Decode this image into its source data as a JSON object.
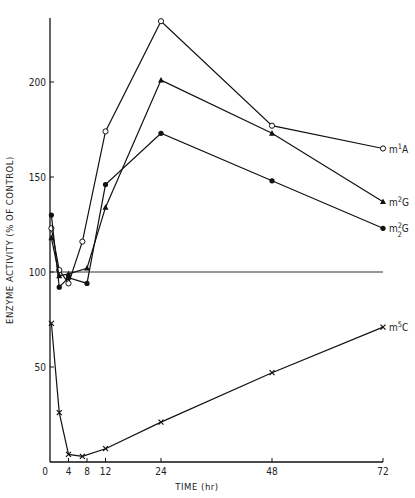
{
  "chart_data": {
    "type": "line",
    "title": "",
    "xlabel": "TIME (hr)",
    "ylabel": "ENZYME ACTIVITY (% OF CONTROL)",
    "xlim": [
      0,
      72
    ],
    "ylim": [
      0,
      240
    ],
    "x_ticks": [
      0,
      4,
      8,
      12,
      24,
      48,
      72
    ],
    "y_ticks": [
      50,
      100,
      150,
      200
    ],
    "reference_line": 100,
    "grid": false,
    "legend_position": "inline-right",
    "series": [
      {
        "name": "m1A",
        "label_main": "m",
        "label_sup": "1",
        "label_sub": "",
        "label_tail": "A",
        "marker": "open-circle",
        "x": [
          0.3,
          2,
          4,
          7,
          12,
          24,
          48,
          72
        ],
        "y": [
          123,
          101,
          94,
          116,
          174,
          232,
          177,
          165
        ]
      },
      {
        "name": "m2G",
        "label_main": "m",
        "label_sup": "2",
        "label_sub": "",
        "label_tail": "G",
        "marker": "filled-triangle",
        "x": [
          0.3,
          2,
          4,
          8,
          12,
          24,
          48,
          72
        ],
        "y": [
          118,
          98,
          99,
          102,
          134,
          201,
          173,
          137
        ]
      },
      {
        "name": "m2 2G",
        "label_main": "m",
        "label_sup": "2",
        "label_sub": "2",
        "label_tail": "G",
        "marker": "filled-circle",
        "x": [
          0.3,
          2,
          4,
          8,
          12,
          24,
          48,
          72
        ],
        "y": [
          130,
          92,
          97,
          94,
          146,
          173,
          148,
          123
        ]
      },
      {
        "name": "m5C",
        "label_main": "m",
        "label_sup": "5",
        "label_sub": "",
        "label_tail": "C",
        "marker": "x-cross",
        "x": [
          0.3,
          2,
          4,
          7,
          12,
          24,
          48,
          72
        ],
        "y": [
          73,
          26,
          4,
          3,
          7,
          21,
          47,
          71
        ]
      }
    ]
  }
}
